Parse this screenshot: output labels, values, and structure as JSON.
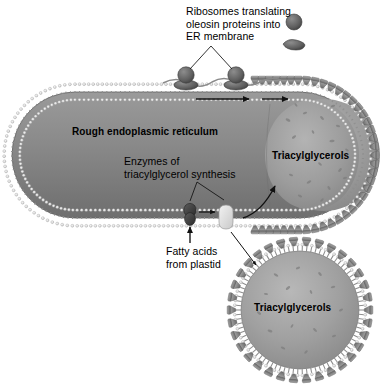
{
  "figure": {
    "background_color": "#ffffff",
    "ink_color": "#000000"
  },
  "labels": {
    "ribosomes": "Ribosomes translating\noleosin proteins into\nER membrane",
    "rough_er": "Rough endoplasmic reticulum",
    "enzymes": "Enzymes of\ntriacylglycerol synthesis",
    "fatty_acids": "Fatty acids\nfrom plastid",
    "triacylglycerols_top": "Triacylglycerols",
    "triacylglycerols_bottom": "Triacylglycerols"
  },
  "palette": {
    "membrane_head": "#e8e8e8",
    "membrane_tail": "#8f8f8f",
    "lumen_fill": "#8c8c8c",
    "lumen_fill_dark": "#6f6f6f",
    "oilbody_fill": "#9a9a9a",
    "oleosin": "#8a8a8a",
    "ribosome_dark": "#5a5a5a",
    "enzyme_dark": "#3a3a3a",
    "enzyme_light": "#e0e0e0",
    "outline": "#4a4a4a"
  },
  "structures": {
    "rough_er": {
      "name": "Rough endoplasmic reticulum",
      "shape": "elongated rounded cisterna",
      "membrane_type": "phospholipid bilayer"
    },
    "oil_body_forming": {
      "name": "Forming oil body",
      "contents": "Triacylglycerols",
      "surface": "phospholipid monolayer with oleosin proteins"
    },
    "oil_body_released": {
      "name": "Released oil body",
      "contents": "Triacylglycerols",
      "surface": "phospholipid monolayer with oleosin proteins"
    },
    "ribosomes": {
      "count_on_membrane": 2,
      "count_free": 2,
      "description": "large and small subunits with mRNA strand"
    },
    "enzymes": {
      "dark": "acyltransferase (dark)",
      "light": "acyltransferase (light)"
    }
  },
  "arrows": {
    "oleosin_lateral_1": "oleosin moves laterally in ER membrane",
    "oleosin_lateral_2": "oleosin moves laterally toward oil body",
    "fatty_acid_import": "fatty acids enter from plastid",
    "enzyme_transfer": "dark enzyme to light enzyme",
    "tag_deposition": "triacylglycerols deposit into forming oil body"
  }
}
